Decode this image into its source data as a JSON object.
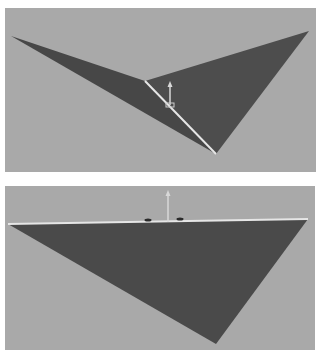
{
  "scene": {
    "background_color": "#ffffff",
    "viewport_color": "#a9a9a9",
    "mesh_color": "#4c4c4c",
    "mesh_color_dark": "#444444",
    "edge_highlight_color": "#e6e6e6",
    "gizmo_color": "#d8d8d8",
    "gizmo_marker_color": "#2a2a2a"
  },
  "viewports": [
    {
      "id": "perspective-view",
      "label": "",
      "mesh": {
        "name": "folded-plane",
        "faces": [
          {
            "name": "left-wing",
            "points": "6,28 140,73 211,146"
          },
          {
            "name": "right-wing",
            "points": "140,73 304,23 211,146"
          }
        ],
        "crease": {
          "x1": 140,
          "y1": 73,
          "x2": 211,
          "y2": 146
        }
      },
      "gizmo": {
        "x": 165,
        "y_top": 73,
        "y_bottom": 97
      }
    },
    {
      "id": "front-view",
      "label": "",
      "mesh": {
        "name": "flat-plane",
        "faces": [
          {
            "name": "main-face",
            "points": "3,38 303,33 211,158"
          }
        ],
        "crease": {
          "x1": 3,
          "y1": 38,
          "x2": 303,
          "y2": 33
        }
      },
      "gizmo": {
        "x": 163,
        "y_top": 4,
        "y_bottom": 36,
        "markers": [
          {
            "x": 143,
            "y": 34
          },
          {
            "x": 175,
            "y": 33
          }
        ]
      }
    }
  ]
}
